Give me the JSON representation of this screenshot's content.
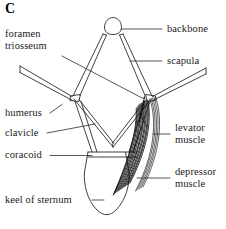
{
  "figure": {
    "panel_letter": "C",
    "background_color": "#ffffff",
    "line_color": "#2b2b2b",
    "muscle_fiber_color": "#111111"
  },
  "labels": {
    "foramen_triosseum": "foramen\ntriosseum",
    "foramen_triosseum_line1": "foramen",
    "foramen_triosseum_line2": "triosseum",
    "humerus": "humerus",
    "clavicle": "clavicle",
    "coracoid": "coracoid",
    "keel_of_sternum": "keel of sternum",
    "backbone": "backbone",
    "scapula": "scapula",
    "levator_line1": "levator",
    "levator_line2": "muscle",
    "depressor_line1": "depressor",
    "depressor_line2": "muscle"
  },
  "parts": [
    {
      "id": "backbone",
      "label": "backbone",
      "side": "right"
    },
    {
      "id": "scapula",
      "label": "scapula",
      "side": "right"
    },
    {
      "id": "levator-muscle",
      "label": "levator muscle",
      "side": "right"
    },
    {
      "id": "depressor-muscle",
      "label": "depressor muscle",
      "side": "right"
    },
    {
      "id": "foramen-triosseum",
      "label": "foramen triosseum",
      "side": "left"
    },
    {
      "id": "humerus",
      "label": "humerus",
      "side": "left"
    },
    {
      "id": "clavicle",
      "label": "clavicle",
      "side": "left"
    },
    {
      "id": "coracoid",
      "label": "coracoid",
      "side": "left"
    },
    {
      "id": "keel-of-sternum",
      "label": "keel of sternum",
      "side": "left"
    }
  ]
}
